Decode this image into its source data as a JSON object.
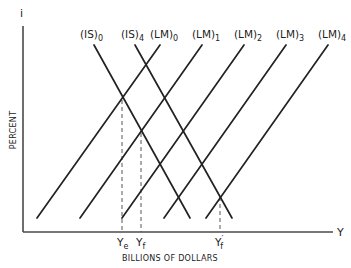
{
  "diagram": {
    "type": "IS-LM",
    "y_axis": {
      "symbol": "i",
      "label": "PERCENT"
    },
    "x_axis": {
      "symbol": "Y",
      "label": "BILLIONS OF DOLLARS"
    },
    "curves": {
      "IS": [
        {
          "name": "(IS)",
          "sub": "0",
          "x1": 94,
          "y1": 45,
          "x2": 190,
          "y2": 218,
          "label_x": 80
        },
        {
          "name": "(IS)",
          "sub": "4",
          "x1": 135,
          "y1": 45,
          "x2": 232,
          "y2": 218,
          "label_x": 121
        }
      ],
      "LM": [
        {
          "name": "(LM)",
          "sub": "0",
          "x1": 37,
          "y1": 218,
          "x2": 160,
          "y2": 45,
          "label_x": 150
        },
        {
          "name": "(LM)",
          "sub": "1",
          "x1": 80,
          "y1": 218,
          "x2": 202,
          "y2": 45,
          "label_x": 192
        },
        {
          "name": "(LM)",
          "sub": "2",
          "x1": 122,
          "y1": 218,
          "x2": 244,
          "y2": 45,
          "label_x": 234
        },
        {
          "name": "(LM)",
          "sub": "3",
          "x1": 164,
          "y1": 218,
          "x2": 286,
          "y2": 45,
          "label_x": 276
        },
        {
          "name": "(LM)",
          "sub": "4",
          "x1": 206,
          "y1": 218,
          "x2": 328,
          "y2": 45,
          "label_x": 318
        }
      ]
    },
    "equilibria": [
      {
        "label": "Y",
        "sub": "e",
        "prime": "",
        "x": 122,
        "y": 100,
        "note": "IS0 ∩ LM0"
      },
      {
        "label": "Y",
        "sub": "f",
        "prime": "",
        "x": 141,
        "y": 133,
        "note": "IS0 ∩ LM1"
      },
      {
        "label": "Y",
        "sub": "f",
        "prime": "′",
        "x": 220,
        "y": 197,
        "note": "IS4 ∩ LM4"
      }
    ]
  }
}
